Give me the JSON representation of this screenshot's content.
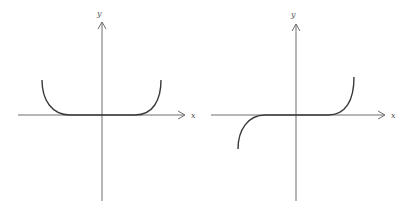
{
  "figures": [
    {
      "name": "even-function-graph",
      "x_label": "x",
      "y_label": "y",
      "description": "Even function: flat on an interval around the origin, rising on both sides (U shape)"
    },
    {
      "name": "odd-function-graph",
      "x_label": "x",
      "y_label": "y",
      "description": "Odd function: flat on an interval around the origin, rising on the right and falling on the left"
    }
  ],
  "colors": {
    "axis": "#6e6e6e",
    "curve": "#3a3a3a",
    "background": "#ffffff"
  }
}
